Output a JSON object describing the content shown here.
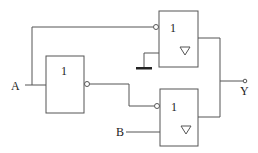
{
  "diagram": {
    "type": "logic-circuit",
    "inputs": [
      {
        "label": "A"
      },
      {
        "label": "B"
      }
    ],
    "output": {
      "label": "Y"
    },
    "gates": [
      {
        "id": "inverter",
        "symbol": "1",
        "kind": "NOT",
        "output_inverted": true
      },
      {
        "id": "tristate-top",
        "symbol": "1",
        "kind": "tri-state buffer",
        "enable_inverted": true,
        "enable_from": "A",
        "data_from": "ground",
        "output_marker": "▽"
      },
      {
        "id": "tristate-bottom",
        "symbol": "1",
        "kind": "tri-state buffer",
        "enable_inverted": true,
        "enable_from": "inverter",
        "data_from": "B",
        "output_marker": "▽"
      }
    ],
    "ground": {
      "present": true
    }
  }
}
